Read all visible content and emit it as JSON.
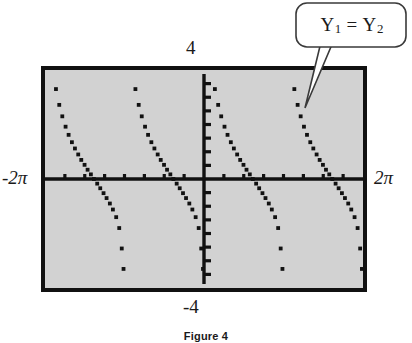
{
  "figure": {
    "caption": "Figure 4",
    "callout": {
      "label_plain": "Y1 = Y2",
      "y1": "Y",
      "y1_sub": "1",
      "equals": "=",
      "y2": "Y",
      "y2_sub": "2"
    }
  },
  "colors": {
    "screen_fill": "#d2d2d2",
    "screen_border": "#111111",
    "axis": "#111111",
    "point": "#111111",
    "page_background": "#ffffff",
    "text": "#1a1a1a",
    "callout_fill": "#ffffff",
    "callout_stroke": "#3a3a3a"
  },
  "chart_data": {
    "type": "scatter",
    "title": "",
    "subtitle": "",
    "xlabel": "",
    "ylabel": "",
    "xlim": [
      -6.283185,
      6.283185
    ],
    "ylim": [
      -4,
      4
    ],
    "xlim_label_min": "-2π",
    "xlim_label_max": "2π",
    "ylim_label_min": "-4",
    "ylim_label_max": "4",
    "grid": false,
    "legend": null,
    "axis_ticks": {
      "x_tick_count": 8,
      "x_tick_values": [
        -5.4978,
        -4.7124,
        -3.927,
        -3.1416,
        -2.3562,
        -1.5708,
        -0.7854,
        0.7854,
        1.5708,
        2.3562,
        3.1416,
        3.927,
        4.7124,
        5.4978
      ],
      "y_tick_count": 8,
      "y_tick_values": [
        -3.5,
        -3.0,
        -2.5,
        -2.0,
        -1.5,
        -1.0,
        -0.5,
        0.5,
        1.0,
        1.5,
        2.0,
        2.5,
        3.0,
        3.5
      ],
      "x_axis_at_y": 0,
      "y_axis_at_x": 0
    },
    "annotations": [
      {
        "text": "Y1 = Y2",
        "target_x": 4.1,
        "target_y": 2.35,
        "placement": "upper-right"
      }
    ],
    "series": [
      {
        "name": "Y1 = Y2",
        "mode": "dot",
        "marker": "square",
        "branches": [
          {
            "branch_index": 0,
            "asymptote_left": -6.283185,
            "asymptote_right": -3.141593,
            "points": [
              {
                "x": -5.85,
                "y": 3.3
              },
              {
                "x": -5.72,
                "y": 2.72
              },
              {
                "x": -5.6,
                "y": 2.3
              },
              {
                "x": -5.47,
                "y": 1.92
              },
              {
                "x": -5.35,
                "y": 1.62
              },
              {
                "x": -5.22,
                "y": 1.35
              },
              {
                "x": -5.1,
                "y": 1.12
              },
              {
                "x": -4.97,
                "y": 0.9
              },
              {
                "x": -4.85,
                "y": 0.7
              },
              {
                "x": -4.72,
                "y": 0.52
              },
              {
                "x": -4.6,
                "y": 0.34
              },
              {
                "x": -4.47,
                "y": 0.17
              },
              {
                "x": -4.35,
                "y": 0.0
              },
              {
                "x": -4.22,
                "y": -0.17
              },
              {
                "x": -4.1,
                "y": -0.34
              },
              {
                "x": -3.97,
                "y": -0.52
              },
              {
                "x": -3.85,
                "y": -0.7
              },
              {
                "x": -3.72,
                "y": -0.9
              },
              {
                "x": -3.6,
                "y": -1.12
              },
              {
                "x": -3.47,
                "y": -1.4
              },
              {
                "x": -3.35,
                "y": -1.8
              },
              {
                "x": -3.25,
                "y": -2.55
              },
              {
                "x": -3.18,
                "y": -3.3
              }
            ]
          },
          {
            "branch_index": 1,
            "asymptote_left": -3.141593,
            "asymptote_right": 0.0,
            "points": [
              {
                "x": -2.71,
                "y": 3.3
              },
              {
                "x": -2.58,
                "y": 2.72
              },
              {
                "x": -2.46,
                "y": 2.3
              },
              {
                "x": -2.33,
                "y": 1.92
              },
              {
                "x": -2.21,
                "y": 1.62
              },
              {
                "x": -2.08,
                "y": 1.35
              },
              {
                "x": -1.96,
                "y": 1.12
              },
              {
                "x": -1.83,
                "y": 0.9
              },
              {
                "x": -1.71,
                "y": 0.7
              },
              {
                "x": -1.58,
                "y": 0.52
              },
              {
                "x": -1.46,
                "y": 0.34
              },
              {
                "x": -1.33,
                "y": 0.17
              },
              {
                "x": -1.21,
                "y": 0.0
              },
              {
                "x": -1.08,
                "y": -0.17
              },
              {
                "x": -0.96,
                "y": -0.34
              },
              {
                "x": -0.83,
                "y": -0.52
              },
              {
                "x": -0.71,
                "y": -0.7
              },
              {
                "x": -0.58,
                "y": -0.9
              },
              {
                "x": -0.46,
                "y": -1.12
              },
              {
                "x": -0.33,
                "y": -1.4
              },
              {
                "x": -0.21,
                "y": -1.8
              },
              {
                "x": -0.11,
                "y": -2.55
              },
              {
                "x": -0.04,
                "y": -3.3
              }
            ]
          },
          {
            "branch_index": 2,
            "asymptote_left": 0.0,
            "asymptote_right": 3.141593,
            "points": [
              {
                "x": 0.43,
                "y": 3.3
              },
              {
                "x": 0.56,
                "y": 2.72
              },
              {
                "x": 0.68,
                "y": 2.3
              },
              {
                "x": 0.81,
                "y": 1.92
              },
              {
                "x": 0.93,
                "y": 1.62
              },
              {
                "x": 1.06,
                "y": 1.35
              },
              {
                "x": 1.18,
                "y": 1.12
              },
              {
                "x": 1.31,
                "y": 0.9
              },
              {
                "x": 1.43,
                "y": 0.7
              },
              {
                "x": 1.56,
                "y": 0.52
              },
              {
                "x": 1.68,
                "y": 0.34
              },
              {
                "x": 1.81,
                "y": 0.17
              },
              {
                "x": 1.93,
                "y": 0.0
              },
              {
                "x": 2.06,
                "y": -0.17
              },
              {
                "x": 2.18,
                "y": -0.34
              },
              {
                "x": 2.31,
                "y": -0.52
              },
              {
                "x": 2.43,
                "y": -0.7
              },
              {
                "x": 2.56,
                "y": -0.9
              },
              {
                "x": 2.68,
                "y": -1.12
              },
              {
                "x": 2.81,
                "y": -1.4
              },
              {
                "x": 2.93,
                "y": -1.8
              },
              {
                "x": 3.03,
                "y": -2.55
              },
              {
                "x": 3.1,
                "y": -3.3
              }
            ]
          },
          {
            "branch_index": 3,
            "asymptote_left": 3.141593,
            "asymptote_right": 6.283185,
            "points": [
              {
                "x": 3.57,
                "y": 3.3
              },
              {
                "x": 3.7,
                "y": 2.72
              },
              {
                "x": 3.82,
                "y": 2.3
              },
              {
                "x": 3.95,
                "y": 1.92
              },
              {
                "x": 4.07,
                "y": 1.62
              },
              {
                "x": 4.2,
                "y": 1.35
              },
              {
                "x": 4.32,
                "y": 1.12
              },
              {
                "x": 4.45,
                "y": 0.9
              },
              {
                "x": 4.57,
                "y": 0.7
              },
              {
                "x": 4.7,
                "y": 0.52
              },
              {
                "x": 4.82,
                "y": 0.34
              },
              {
                "x": 4.95,
                "y": 0.17
              },
              {
                "x": 5.07,
                "y": 0.0
              },
              {
                "x": 5.2,
                "y": -0.17
              },
              {
                "x": 5.32,
                "y": -0.34
              },
              {
                "x": 5.45,
                "y": -0.52
              },
              {
                "x": 5.57,
                "y": -0.7
              },
              {
                "x": 5.7,
                "y": -0.9
              },
              {
                "x": 5.82,
                "y": -1.12
              },
              {
                "x": 5.95,
                "y": -1.4
              },
              {
                "x": 6.07,
                "y": -1.8
              },
              {
                "x": 6.17,
                "y": -2.55
              },
              {
                "x": 6.24,
                "y": -3.3
              }
            ]
          }
        ]
      }
    ]
  }
}
